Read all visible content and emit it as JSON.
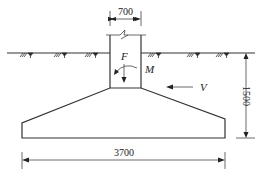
{
  "diagram": {
    "type": "foundation-section",
    "dimensions": {
      "column_width": "700",
      "footing_width": "3700",
      "footing_depth": "1500"
    },
    "loads": {
      "axial": "F",
      "moment": "M",
      "shear": "V"
    },
    "colors": {
      "line": "#333333",
      "background": "#ffffff"
    }
  }
}
